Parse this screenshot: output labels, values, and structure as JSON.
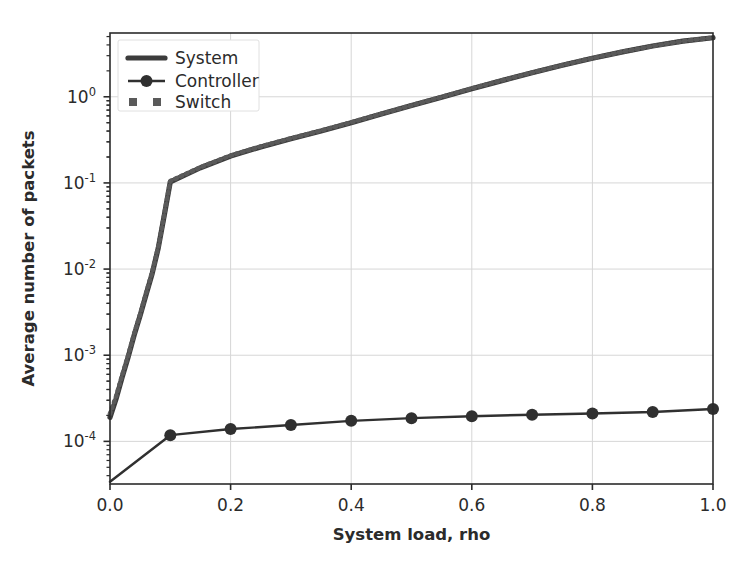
{
  "chart_data": {
    "type": "line",
    "title": "",
    "xlabel": "System load, rho",
    "ylabel": "Average number of packets",
    "xlim": [
      0.0,
      1.0
    ],
    "ylim": [
      3.2e-05,
      5.5
    ],
    "yscale": "log",
    "xscale": "linear",
    "grid": true,
    "grid_color": "#d6d6d6",
    "legend_position": "upper left",
    "xticks": [
      "0.0",
      "0.2",
      "0.4",
      "0.6",
      "0.8",
      "1.0"
    ],
    "xtick_values": [
      0.0,
      0.2,
      0.4,
      0.6,
      0.8,
      1.0
    ],
    "yticks": [
      "10^0",
      "10^-1",
      "10^-2",
      "10^-3",
      "10^-4"
    ],
    "ytick_values": [
      1.0,
      0.1,
      0.01,
      0.001,
      0.0001
    ],
    "ytick_mantissa": [
      "10",
      "10",
      "10",
      "10",
      "10"
    ],
    "ytick_exponents": [
      "0",
      "-1",
      "-2",
      "-3",
      "-4"
    ],
    "series": [
      {
        "name": "System",
        "color": "#3c3c3c",
        "style": "solid-thick",
        "marker": "none",
        "x": [
          0.0,
          0.01,
          0.02,
          0.03,
          0.04,
          0.05,
          0.06,
          0.07,
          0.08,
          0.09,
          0.1,
          0.15,
          0.2,
          0.25,
          0.3,
          0.35,
          0.4,
          0.45,
          0.5,
          0.55,
          0.6,
          0.65,
          0.7,
          0.75,
          0.8,
          0.85,
          0.9,
          0.95,
          1.0
        ],
        "y": [
          0.00019,
          0.00031,
          0.00055,
          0.00095,
          0.0017,
          0.0029,
          0.0051,
          0.0089,
          0.0175,
          0.042,
          0.103,
          0.15,
          0.205,
          0.262,
          0.325,
          0.4,
          0.5,
          0.63,
          0.79,
          0.99,
          1.24,
          1.54,
          1.9,
          2.32,
          2.8,
          3.32,
          3.88,
          4.42,
          4.85
        ]
      },
      {
        "name": "Controller",
        "color": "#303030",
        "style": "solid",
        "marker": "circle",
        "x": [
          0.0,
          0.1,
          0.2,
          0.3,
          0.4,
          0.5,
          0.6,
          0.7,
          0.8,
          0.9,
          1.0
        ],
        "y": [
          3.4e-05,
          0.000118,
          0.000139,
          0.000155,
          0.000173,
          0.000186,
          0.000196,
          0.000204,
          0.000211,
          0.000219,
          0.000238
        ]
      },
      {
        "name": "Switch",
        "color": "#5a5a5a",
        "style": "dotted",
        "marker": "square",
        "x": [
          0.0,
          0.01,
          0.02,
          0.03,
          0.04,
          0.05,
          0.06,
          0.07,
          0.08,
          0.09,
          0.1,
          0.15,
          0.2,
          0.25,
          0.3,
          0.35,
          0.4,
          0.45,
          0.5,
          0.55,
          0.6,
          0.65,
          0.7,
          0.75,
          0.8,
          0.85,
          0.9,
          0.95,
          1.0
        ],
        "y": [
          0.00021,
          0.00033,
          0.00058,
          0.00099,
          0.00177,
          0.003,
          0.0053,
          0.0092,
          0.018,
          0.043,
          0.105,
          0.152,
          0.208,
          0.265,
          0.329,
          0.405,
          0.505,
          0.635,
          0.795,
          0.995,
          1.25,
          1.55,
          1.91,
          2.33,
          2.81,
          3.33,
          3.89,
          4.43,
          4.86
        ]
      }
    ]
  },
  "legend": {
    "items": [
      {
        "label": "System",
        "glyph": "line-thick"
      },
      {
        "label": "Controller",
        "glyph": "line-circle-marker"
      },
      {
        "label": "Switch",
        "glyph": "dotted-square-marker"
      }
    ]
  },
  "axes": {
    "xlabel": "System load, rho",
    "ylabel": "Average number of packets"
  }
}
